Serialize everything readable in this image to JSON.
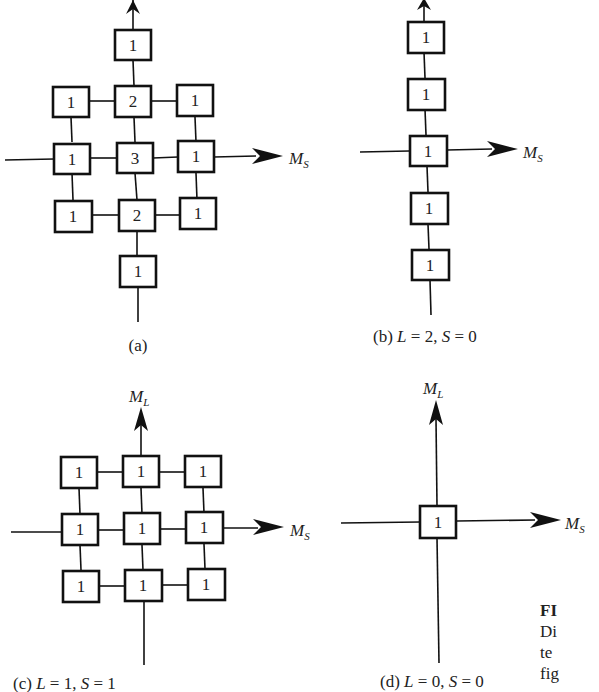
{
  "figure": {
    "panels": [
      {
        "id": "a",
        "caption": "(a)",
        "axis_x_label": "M",
        "axis_x_sub": "S",
        "axis_y_label": "",
        "axis_y_sub": "",
        "rows": [
          [
            "",
            "1",
            ""
          ],
          [
            "1",
            "2",
            "1"
          ],
          [
            "1",
            "3",
            "1"
          ],
          [
            "1",
            "2",
            "1"
          ],
          [
            "",
            "1",
            ""
          ]
        ]
      },
      {
        "id": "b",
        "caption": "(b) L = 2, S = 0",
        "caption_parts": {
          "prefix": "(b) ",
          "L": "L",
          "eq1": " = 2, ",
          "S": "S",
          "eq2": " = 0"
        },
        "axis_x_label": "M",
        "axis_x_sub": "S",
        "column": [
          "1",
          "1",
          "1",
          "1",
          "1"
        ]
      },
      {
        "id": "c",
        "caption": "(c) L = 1, S = 1",
        "caption_parts": {
          "prefix": "(c) ",
          "L": "L",
          "eq1": " = 1, ",
          "S": "S",
          "eq2": " = 1"
        },
        "axis_x_label": "M",
        "axis_x_sub": "S",
        "axis_y_label": "M",
        "axis_y_sub": "L",
        "rows": [
          [
            "1",
            "1",
            "1"
          ],
          [
            "1",
            "1",
            "1"
          ],
          [
            "1",
            "1",
            "1"
          ]
        ]
      },
      {
        "id": "d",
        "caption": "(d) L = 0, S = 0",
        "caption_parts": {
          "prefix": "(d) ",
          "L": "L",
          "eq1": " = 0, ",
          "S": "S",
          "eq2": " = 0"
        },
        "axis_x_label": "M",
        "axis_x_sub": "S",
        "axis_y_label": "M",
        "axis_y_sub": "L",
        "center": "1"
      }
    ],
    "side_text": {
      "line1": "FI",
      "line2": "Di",
      "line3": "te",
      "line4": "fig"
    }
  }
}
